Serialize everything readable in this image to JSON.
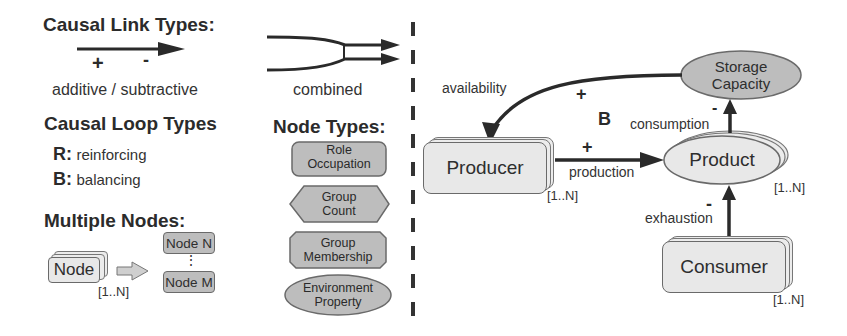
{
  "legend": {
    "causal_link_types": {
      "title": "Causal Link Types:",
      "plus": "+",
      "minus": "-",
      "caption": "additive / subtractive",
      "combined_caption": "combined"
    },
    "causal_loop_types": {
      "title": "Causal Loop Types",
      "items": [
        {
          "key": "R:",
          "label": "reinforcing"
        },
        {
          "key": "B:",
          "label": "balancing"
        }
      ]
    },
    "multiple_nodes": {
      "title": "Multiple Nodes:",
      "node_label": "Node",
      "multiplicity": "[1..N]",
      "expanded_first": "Node N",
      "ellipsis": "⋮",
      "expanded_last": "Node M"
    },
    "node_types": {
      "title": "Node Types:",
      "items": [
        {
          "line1": "Role",
          "line2": "Occupation",
          "shape": "rounded-rect"
        },
        {
          "line1": "Group",
          "line2": "Count",
          "shape": "hexagon"
        },
        {
          "line1": "Group",
          "line2": "Membership",
          "shape": "octagon"
        },
        {
          "line1": "Environment",
          "line2": "Property",
          "shape": "ellipse"
        }
      ]
    }
  },
  "model": {
    "nodes": {
      "storage_capacity": {
        "line1": "Storage",
        "line2": "Capacity"
      },
      "producer": {
        "label": "Producer",
        "multiplicity": "[1..N]"
      },
      "product": {
        "label": "Product",
        "multiplicity": "[1..N]"
      },
      "consumer": {
        "label": "Consumer",
        "multiplicity": "[1..N]"
      }
    },
    "links": {
      "availability": {
        "label": "availability",
        "sign": "+"
      },
      "production": {
        "label": "production",
        "sign": "+"
      },
      "consumption": {
        "label": "consumption",
        "sign": "-"
      },
      "exhaustion": {
        "label": "exhaustion",
        "sign": "-"
      }
    },
    "loop_marker": "B"
  },
  "colors": {
    "stroke": "#2a2a2a",
    "node_fill_light": "#e8e8e8",
    "node_fill_dark": "#bdbdbd"
  }
}
